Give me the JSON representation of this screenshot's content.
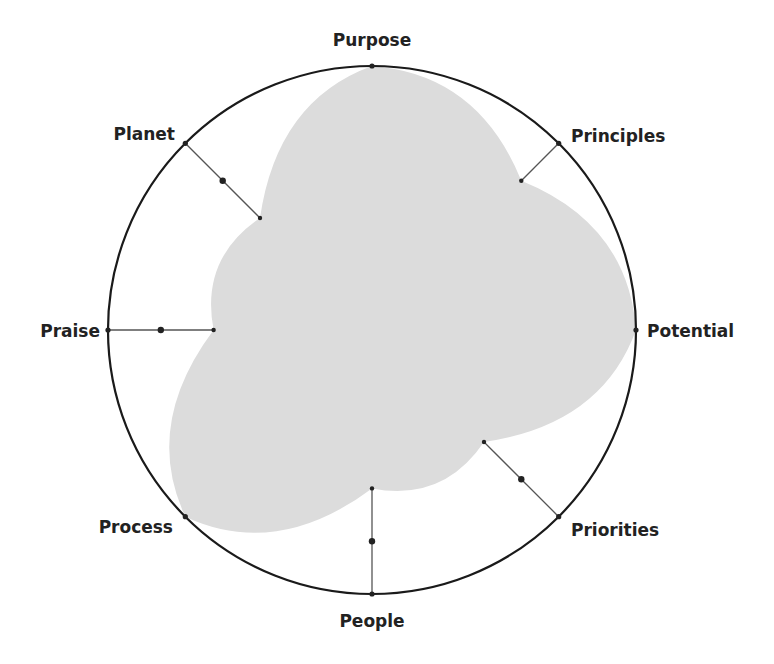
{
  "chart_data": {
    "type": "radar",
    "title": "",
    "categories": [
      "Purpose",
      "Principles",
      "Potential",
      "Priorities",
      "People",
      "Process",
      "Praise",
      "Planet"
    ],
    "series": [
      {
        "name": "Score",
        "values": [
          1.0,
          0.8,
          1.0,
          0.6,
          0.6,
          1.0,
          0.6,
          0.6
        ]
      }
    ],
    "rlim": [
      0,
      1
    ],
    "spoke_marker_at": 0.8,
    "grid": false,
    "legend": false,
    "colors": {
      "fill": "#dcdcdc",
      "outline": "#1a1a1a",
      "spoke": "#555555",
      "marker": "#222222",
      "label": "#222222"
    }
  },
  "labels": {
    "purpose": "Purpose",
    "principles": "Principles",
    "potential": "Potential",
    "priorities": "Priorities",
    "people": "People",
    "process": "Process",
    "praise": "Praise",
    "planet": "Planet"
  }
}
